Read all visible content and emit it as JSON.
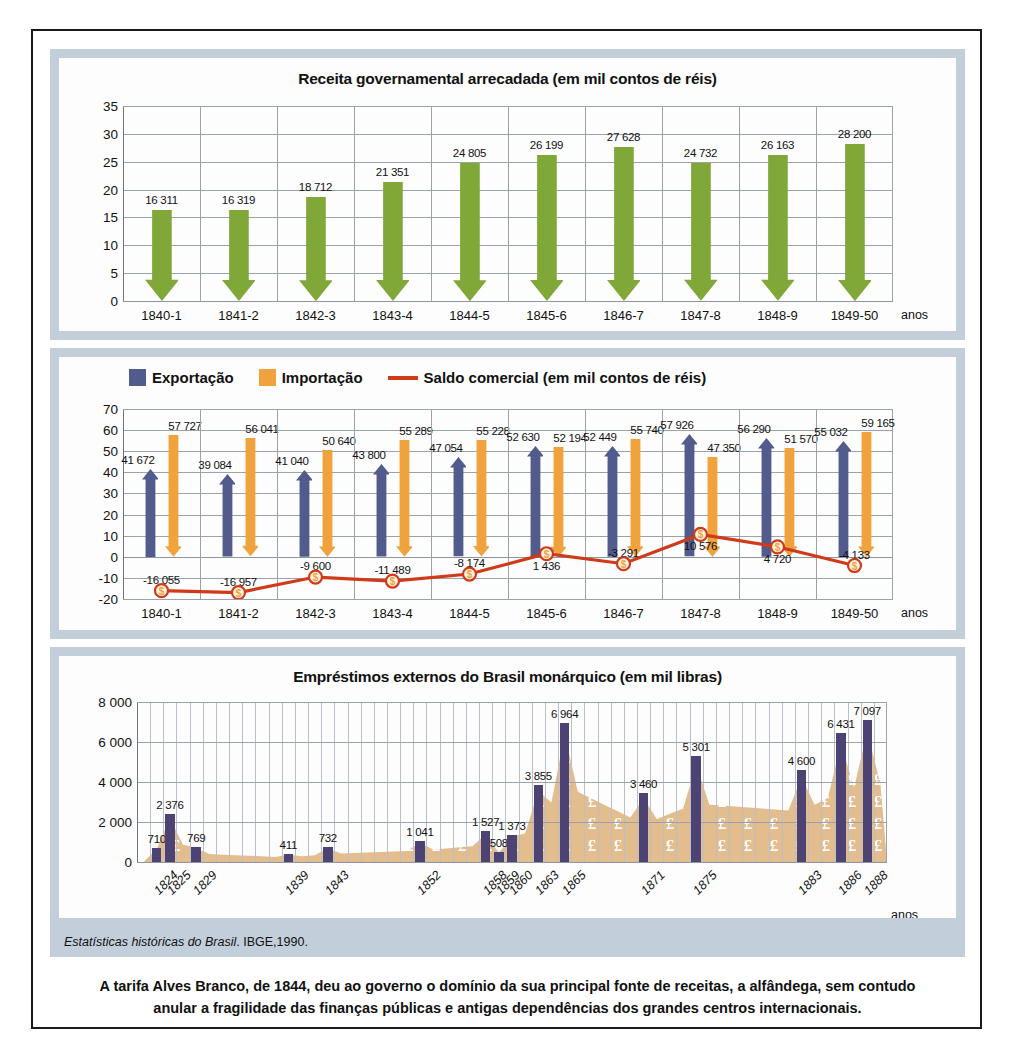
{
  "source": {
    "italic": "Estatísticas históricas do Brasil",
    "rest": ". IBGE,1990."
  },
  "caption": {
    "line1": "A tarifa Alves Branco, de 1844, deu ao governo o domínio da sua principal fonte de receitas, a alfândega, sem contudo",
    "line2": "anular a fragilidade das finanças públicas e antigas dependências dos grandes centros internacionais."
  },
  "colors": {
    "green": "#7fa838",
    "blue": "#515b8c",
    "orange": "#f0a23c",
    "red_line": "#cf3a1a",
    "purple": "#4c4273",
    "area_tan": "#e4bd8e",
    "panel_border": "#c3cedb"
  },
  "chart_data": [
    {
      "id": "receita",
      "type": "bar",
      "title": "Receita governamental arrecadada (em mil contos de réis)",
      "xlabel": "anos",
      "ylabel": "",
      "ylim": [
        0,
        35
      ],
      "yticks": [
        0,
        5,
        10,
        15,
        20,
        25,
        30,
        35
      ],
      "grid": true,
      "categories": [
        "1840-1",
        "1841-2",
        "1842-3",
        "1843-4",
        "1844-5",
        "1845-6",
        "1846-7",
        "1847-8",
        "1848-9",
        "1849-50"
      ],
      "values": [
        16.311,
        16.319,
        18.712,
        21.351,
        24.805,
        26.199,
        27.628,
        24.732,
        26.163,
        28.2
      ],
      "labels": [
        "16 311",
        "16 319",
        "18 712",
        "21 351",
        "24 805",
        "26 199",
        "27 628",
        "24 732",
        "26 163",
        "28 200"
      ],
      "series_name": "Receita governamental arrecadada",
      "marker_shape": "down-arrow-bar"
    },
    {
      "id": "comercio",
      "type": "bar-line-combo",
      "title": "",
      "xlabel": "anos",
      "ylabel": "",
      "ylim": [
        -20,
        70
      ],
      "yticks": [
        -20,
        -10,
        0,
        10,
        20,
        30,
        40,
        50,
        60,
        70
      ],
      "grid": true,
      "legend_position": "top-left",
      "legend": [
        {
          "label": "Exportação",
          "type": "swatch",
          "color": "#515b8c"
        },
        {
          "label": "Importação",
          "type": "swatch",
          "color": "#f0a23c"
        },
        {
          "label": "Saldo comercial (em mil contos de réis)",
          "type": "line",
          "color": "#cf3a1a"
        }
      ],
      "categories": [
        "1840-1",
        "1841-2",
        "1842-3",
        "1843-4",
        "1844-5",
        "1845-6",
        "1846-7",
        "1847-8",
        "1848-9",
        "1849-50"
      ],
      "series": [
        {
          "name": "Exportação",
          "color": "#515b8c",
          "marker_shape": "up-arrow-bar",
          "values": [
            41.672,
            39.084,
            41.04,
            43.8,
            47.054,
            52.63,
            52.449,
            57.926,
            56.29,
            55.032
          ],
          "labels": [
            "41 672",
            "39 084",
            "41 040",
            "43 800",
            "47 054",
            "52 630",
            "52 449",
            "57 926",
            "56 290",
            "55 032"
          ]
        },
        {
          "name": "Importação",
          "color": "#f0a23c",
          "marker_shape": "down-arrow-bar",
          "values": [
            57.727,
            56.041,
            50.64,
            55.289,
            55.228,
            52.194,
            55.74,
            47.35,
            51.57,
            59.165
          ],
          "labels": [
            "57 727",
            "56 041",
            "50 640",
            "55 289",
            "55 228",
            "52 194",
            "55 740",
            "47 350",
            "51 570",
            "59 165"
          ]
        },
        {
          "name": "Saldo comercial (em mil contos de réis)",
          "color": "#cf3a1a",
          "marker_shape": "dollar-coin",
          "values": [
            -16.055,
            -16.957,
            -9.6,
            -11.489,
            -8.174,
            1.436,
            -3.291,
            10.576,
            4.72,
            -4.133
          ],
          "labels": [
            "-16 055",
            "-16 957",
            "-9 600",
            "-11 489",
            "-8 174",
            "1 436",
            "-3 291",
            "10 576",
            "4 720",
            "-4 133"
          ]
        }
      ]
    },
    {
      "id": "emprestimos",
      "type": "bar",
      "title": "Empréstimos externos do Brasil monárquico (em mil libras)",
      "xlabel": "anos",
      "ylabel": "",
      "ylim": [
        0,
        8000
      ],
      "yticks": [
        0,
        2000,
        4000,
        6000,
        8000
      ],
      "ytick_labels": [
        "0",
        "2 000",
        "4 000",
        "6 000",
        "8 000"
      ],
      "grid": true,
      "categories": [
        "1824",
        "1825",
        "1829",
        "1839",
        "1843",
        "1852",
        "1858",
        "1859",
        "1860",
        "1863",
        "1865",
        "1871",
        "1875",
        "1883",
        "1886",
        "1888"
      ],
      "category_slots": [
        1,
        2,
        4,
        11,
        14,
        21,
        26,
        27,
        28,
        30,
        32,
        38,
        42,
        50,
        53,
        55
      ],
      "total_slots": 57,
      "values": [
        710,
        2376,
        769,
        411,
        732,
        1041,
        1527,
        508,
        1373,
        3855,
        6964,
        3460,
        5301,
        4600,
        6431,
        7097
      ],
      "labels": [
        "710",
        "2 376",
        "769",
        "411",
        "732",
        "1 041",
        "1 527",
        "508",
        "1 373",
        "3 855",
        "6 964",
        "3 460",
        "5 301",
        "4 600",
        "6 431",
        "7 097"
      ],
      "series_name": "Empréstimos externos",
      "xlabel_rotation": -45,
      "background_area": {
        "name": "pound-sterling-texture-area",
        "color": "#e4bd8e"
      }
    }
  ]
}
